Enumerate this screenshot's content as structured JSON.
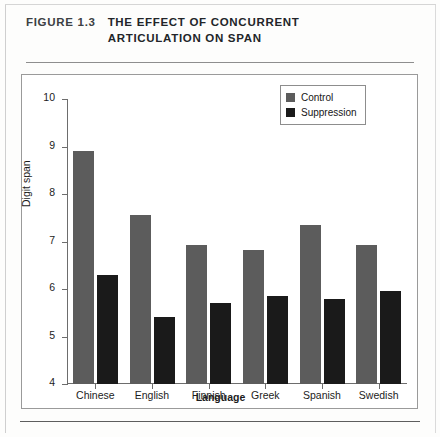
{
  "figure": {
    "number": "FIGURE 1.3",
    "title": "THE EFFECT OF CONCURRENT ARTICULATION ON SPAN"
  },
  "colors": {
    "control": "#5c5c5c",
    "suppression": "#1a1a1a",
    "axis": "#6d6d6d",
    "panel_border": "#9a9a9a"
  },
  "chart_data": {
    "type": "bar",
    "title": "THE EFFECT OF CONCURRENT ARTICULATION ON SPAN",
    "xlabel": "Language",
    "ylabel": "Digit span",
    "categories": [
      "Chinese",
      "English",
      "Finnish",
      "Greek",
      "Spanish",
      "Swedish"
    ],
    "series": [
      {
        "name": "Control",
        "color": "#5c5c5c",
        "values": [
          8.9,
          7.55,
          6.93,
          6.83,
          7.35,
          6.93
        ]
      },
      {
        "name": "Suppression",
        "color": "#1a1a1a",
        "values": [
          6.3,
          5.42,
          5.7,
          5.85,
          5.78,
          5.95
        ]
      }
    ],
    "ylim": [
      4,
      10
    ],
    "yticks": [
      4,
      5,
      6,
      7,
      8,
      9,
      10
    ],
    "ytick_labels": [
      "4",
      "5",
      "6",
      "7",
      "8",
      "9",
      "10"
    ],
    "grid": false,
    "legend_position": "top-right",
    "legend_entries": [
      "Control",
      "Suppression"
    ]
  }
}
